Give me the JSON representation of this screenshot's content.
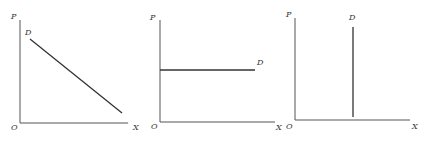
{
  "colors": {
    "axis": "#555555",
    "curve": "#333333",
    "background": "#ffffff"
  },
  "panels": [
    {
      "id": "downward-sloping-demand",
      "y_label": "P",
      "x_label": "X",
      "origin_label": "O",
      "curve_label": "D",
      "curve_type": "downward-sloping"
    },
    {
      "id": "perfectly-elastic-demand",
      "y_label": "P",
      "x_label": "X",
      "origin_label": "O",
      "curve_label": "D",
      "curve_type": "horizontal"
    },
    {
      "id": "perfectly-inelastic-demand",
      "y_label": "P",
      "x_label": "X",
      "origin_label": "O",
      "curve_label": "D",
      "curve_type": "vertical"
    }
  ]
}
